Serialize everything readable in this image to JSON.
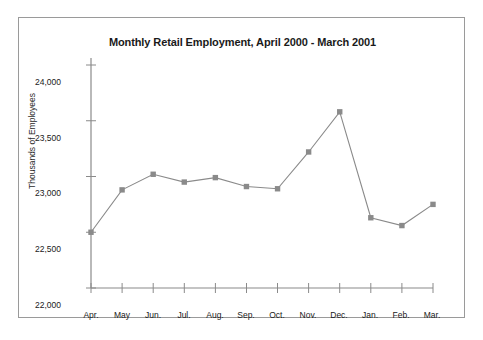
{
  "chart_data": {
    "type": "line",
    "title": "Monthly Retail Employment, April 2000 - March 2001",
    "xlabel": "",
    "ylabel": "Thousands of Employees",
    "categories": [
      "Apr.",
      "May",
      "Jun.",
      "Jul.",
      "Aug.",
      "Sep.",
      "Oct.",
      "Nov.",
      "Dec.",
      "Jan.",
      "Feb.",
      "Mar."
    ],
    "values": [
      22500,
      22880,
      23020,
      22950,
      22990,
      22910,
      22890,
      23220,
      23580,
      22630,
      22560,
      22750
    ],
    "ylim": [
      22000,
      24000
    ],
    "yticks": [
      22000,
      22500,
      23000,
      23500,
      24000
    ],
    "ytick_labels": [
      "22,000",
      "22,500",
      "23,000",
      "23,500",
      "24,000"
    ],
    "grid": false,
    "legend": false,
    "series_color": "#8a8a8a",
    "marker": "square",
    "line_color": "#8a8a8a"
  },
  "figure": {
    "border_color": "#9a9a9a",
    "background": "#ffffff",
    "axis_color": "#8a8a8a",
    "text_color": "#1a1a1a"
  }
}
